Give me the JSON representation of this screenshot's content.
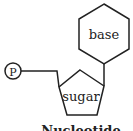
{
  "diagram": {
    "title": "Nucleotide",
    "components": {
      "phosphate": {
        "label": "P"
      },
      "sugar": {
        "label": "sugar"
      },
      "base": {
        "label": "base"
      }
    },
    "colors": {
      "stroke": "#222222",
      "background": "#ffffff"
    }
  }
}
